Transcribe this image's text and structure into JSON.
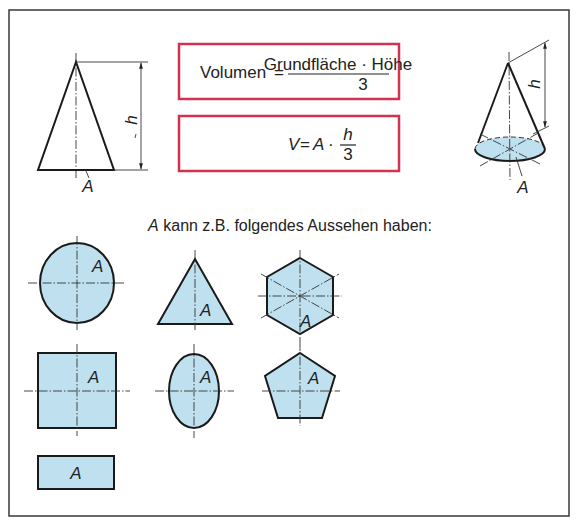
{
  "diagram": {
    "topic": "Volumen von Kegel und Pyramide",
    "formula_words": {
      "lhs": "Volumen",
      "equals": "=",
      "numerator": "Grundfläche · Höhe",
      "denominator": "3"
    },
    "formula_symbols": {
      "lhs": "V",
      "equals": "=",
      "factor": "A",
      "dot": "·",
      "numerator": "h",
      "denominator": "3"
    },
    "left_figure": {
      "shape": "cone/pyramid side view (triangle)",
      "height_label": "h",
      "base_label": "A"
    },
    "right_figure": {
      "shape": "cone in perspective",
      "height_label": "h",
      "base_label": "A"
    },
    "subtitle": {
      "italic_prefix": "A",
      "text": " kann z.B. folgendes Aussehen haben:"
    },
    "base_shapes": [
      {
        "shape": "circle",
        "label": "A"
      },
      {
        "shape": "triangle",
        "label": "A"
      },
      {
        "shape": "hexagon",
        "label": "A"
      },
      {
        "shape": "square",
        "label": "A"
      },
      {
        "shape": "ellipse",
        "label": "A"
      },
      {
        "shape": "pentagon",
        "label": "A"
      },
      {
        "shape": "rectangle",
        "label": "A"
      }
    ],
    "colors": {
      "fill": "#bfe0ef",
      "formula_border": "#d2334f",
      "line": "#1a1a1a"
    }
  }
}
